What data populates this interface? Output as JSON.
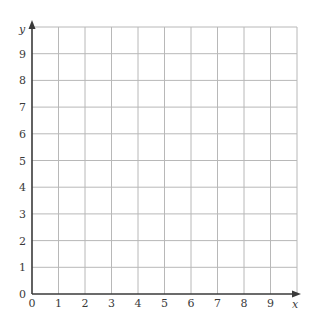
{
  "chart_data": {
    "type": "scatter",
    "title": "",
    "xlabel": "x",
    "ylabel": "y",
    "xlim": [
      0,
      10
    ],
    "ylim": [
      0,
      10
    ],
    "x_ticks": [
      0,
      1,
      2,
      3,
      4,
      5,
      6,
      7,
      8,
      9
    ],
    "y_ticks": [
      0,
      1,
      2,
      3,
      4,
      5,
      6,
      7,
      8,
      9
    ],
    "grid": true,
    "series": [],
    "legend": null
  },
  "colors": {
    "grid": "#b8b8b8",
    "axis": "#3a3a3a",
    "text": "#3a3a3a"
  }
}
